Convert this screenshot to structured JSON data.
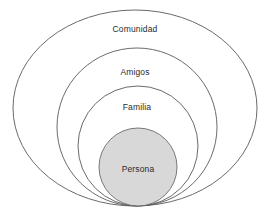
{
  "diagram": {
    "type": "nested-ellipses",
    "title": "",
    "canvas": {
      "width": 270,
      "height": 215,
      "background": "#ffffff"
    },
    "style": {
      "outline_color": "#595959",
      "outline_width": 0.9,
      "core_fill": "#d8d8d8",
      "core_stroke": "#6b6b6b",
      "label_color": "#2b2b2b"
    },
    "layers": [
      {
        "id": "comunidad",
        "label": "Comunidad",
        "level": 4,
        "shape": "ellipse",
        "cx": 135,
        "cy": 108,
        "rx": 122,
        "ry": 98,
        "label_x": 135,
        "label_y": 29
      },
      {
        "id": "amigos",
        "label": "Amigos",
        "level": 3,
        "shape": "ellipse",
        "cx": 137,
        "cy": 127,
        "rx": 80,
        "ry": 79,
        "label_x": 135,
        "label_y": 72
      },
      {
        "id": "familia",
        "label": "Familia",
        "level": 2,
        "shape": "ellipse",
        "cx": 138,
        "cy": 146,
        "rx": 60,
        "ry": 60,
        "label_x": 137,
        "label_y": 107
      },
      {
        "id": "persona",
        "label": "Persona",
        "level": 1,
        "shape": "circle",
        "cx": 138,
        "cy": 167,
        "rx": 39,
        "ry": 39,
        "label_x": 138,
        "label_y": 169
      }
    ]
  }
}
